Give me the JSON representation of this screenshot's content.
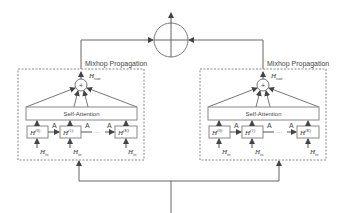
{
  "diagram": {
    "type": "architecture",
    "top_operator": {
      "symbol": "⊕",
      "meaning": "aggregation"
    },
    "modules": [
      {
        "title": "Mixhop Propagation",
        "output_label": "H",
        "output_sub": "out",
        "sum_symbol": "+",
        "attention_label": "Self-Attention",
        "hop_boxes": [
          {
            "base": "H",
            "sup": "(0)"
          },
          {
            "base": "H",
            "sup": "(1)"
          },
          {
            "base": "H",
            "sup": "(K)"
          }
        ],
        "edge_label": "A",
        "ellipsis": "···",
        "input_label": "H",
        "input_sub": "in"
      },
      {
        "title": "Mixhop Propagation",
        "output_label": "H",
        "output_sub": "out",
        "sum_symbol": "+",
        "attention_label": "Self-Attention",
        "hop_boxes": [
          {
            "base": "H",
            "sup": "(0)"
          },
          {
            "base": "H",
            "sup": "(1)"
          },
          {
            "base": "H",
            "sup": "(K)"
          }
        ],
        "edge_label": "A",
        "ellipsis": "···",
        "input_label": "H",
        "input_sub": "in"
      }
    ],
    "colors": {
      "line": "#555555",
      "dashed_border": "#888888",
      "text": "#444444"
    }
  }
}
